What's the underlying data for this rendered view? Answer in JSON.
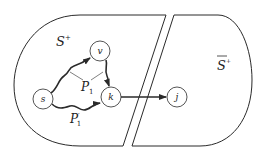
{
  "diagram": {
    "regions": [
      {
        "id": "S_plus",
        "label": "S",
        "superscript": "+",
        "overline": false
      },
      {
        "id": "S_plus_complement",
        "label": "S",
        "superscript": "+",
        "overline": true
      }
    ],
    "nodes": [
      {
        "id": "s",
        "label": "s",
        "cx": 43,
        "cy": 99,
        "r": 10
      },
      {
        "id": "v",
        "label": "v",
        "cx": 100,
        "cy": 51,
        "r": 10
      },
      {
        "id": "k",
        "label": "k",
        "cx": 111,
        "cy": 97,
        "r": 10
      },
      {
        "id": "j",
        "label": "j",
        "cx": 177,
        "cy": 97,
        "r": 10
      }
    ],
    "paths": [
      {
        "id": "P1",
        "label": "P",
        "subscript": "1",
        "prime": false,
        "route": "s → v → k"
      },
      {
        "id": "P1prime",
        "label": "P",
        "subscript": "1",
        "prime": true,
        "route": "s → k"
      }
    ],
    "edges": [
      {
        "from": "k",
        "to": "j",
        "type": "straight-arrow"
      }
    ],
    "colors": {
      "stroke": "#2a2a2a",
      "background": "#ffffff"
    }
  }
}
